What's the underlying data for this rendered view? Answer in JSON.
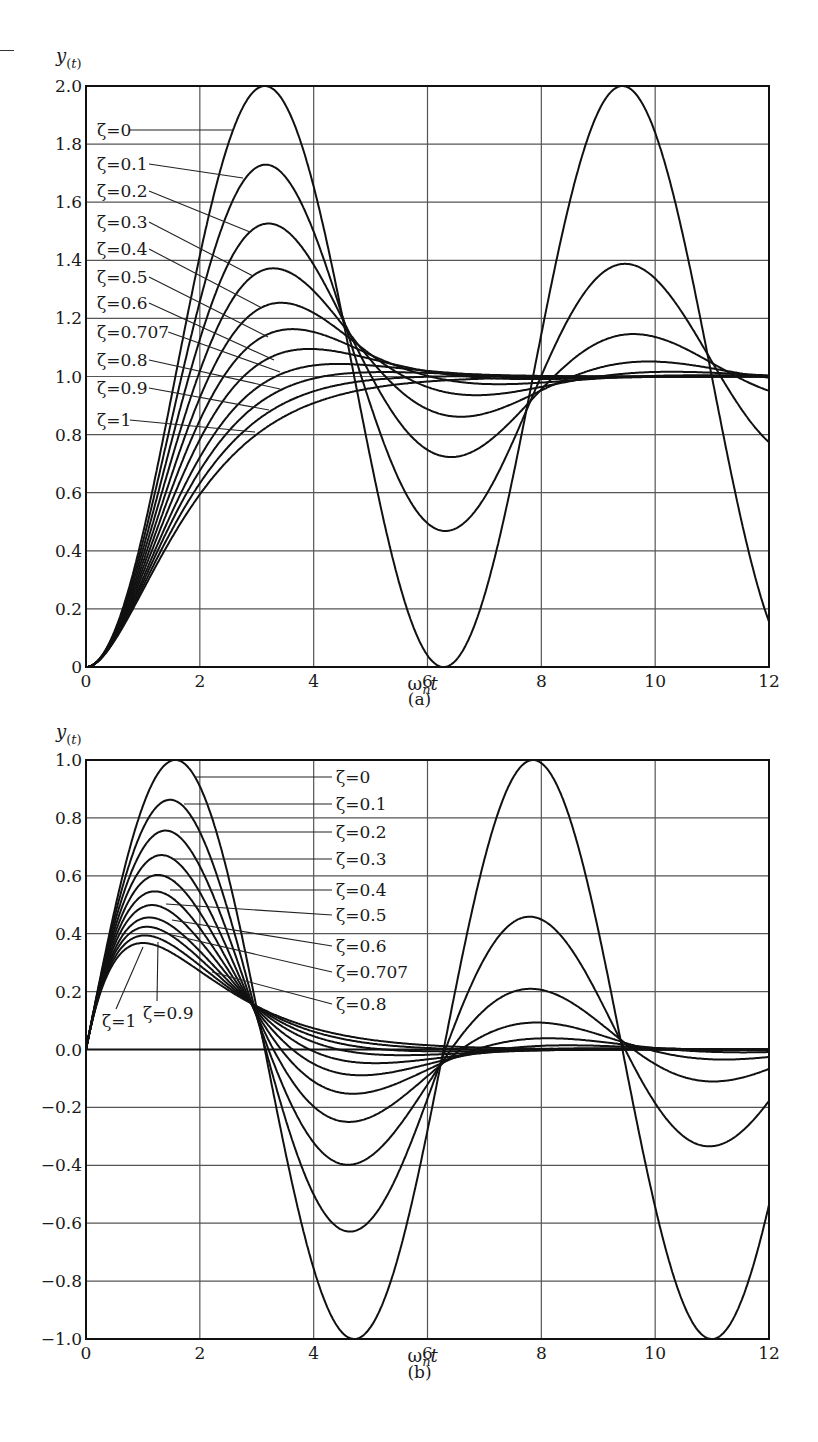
{
  "figure": {
    "captions": [
      "(a)",
      "(b)"
    ]
  },
  "chart_data": [
    {
      "type": "line",
      "title": "(a)",
      "xlabel": "ω_n t",
      "ylabel": "y(t)",
      "xlim": [
        0,
        12
      ],
      "ylim": [
        0,
        2.0
      ],
      "xticks": [
        "0",
        "2",
        "4",
        "6",
        "8",
        "10",
        "12"
      ],
      "yticks": [
        "0",
        "0.2",
        "0.4",
        "0.6",
        "0.8",
        "1.0",
        "1.2",
        "1.4",
        "1.6",
        "1.8",
        "2.0"
      ],
      "grid": true,
      "response": "step",
      "x": [
        0,
        1,
        2,
        3,
        4,
        5,
        6,
        7,
        8,
        9,
        10,
        11,
        12
      ],
      "series": [
        {
          "name": "ζ=0",
          "zeta": 0,
          "values": [
            0,
            0.46,
            1.42,
            1.99,
            1.65,
            0.72,
            0.04,
            0.25,
            1.15,
            1.91,
            1.84,
            1.0,
            0.16
          ],
          "peak": 2.0
        },
        {
          "name": "ζ=0.1",
          "zeta": 0.1,
          "values": [
            0,
            0.44,
            1.32,
            1.72,
            1.43,
            0.87,
            0.53,
            0.76,
            1.16,
            1.38,
            1.29,
            0.99,
            0.78
          ],
          "peak": 1.73
        },
        {
          "name": "ζ=0.2",
          "zeta": 0.2,
          "values": [
            0,
            0.42,
            1.23,
            1.52,
            1.28,
            0.94,
            0.74,
            0.88,
            1.1,
            1.16,
            1.1,
            0.99,
            0.95
          ],
          "peak": 1.53
        },
        {
          "name": "ζ=0.3",
          "zeta": 0.3,
          "values": [
            0,
            0.4,
            1.15,
            1.37,
            1.18,
            0.97,
            0.86,
            0.94,
            1.05,
            1.06,
            1.03,
            1.0,
            0.99
          ],
          "peak": 1.37
        },
        {
          "name": "ζ=0.4",
          "zeta": 0.4,
          "values": [
            0,
            0.38,
            1.08,
            1.25,
            1.12,
            0.99,
            0.93,
            0.97,
            1.02,
            1.02,
            1.01,
            1.0,
            1.0
          ],
          "peak": 1.25
        },
        {
          "name": "ζ=0.5",
          "zeta": 0.5,
          "values": [
            0,
            0.36,
            1.02,
            1.16,
            1.08,
            1.0,
            0.97,
            0.99,
            1.0,
            1.0,
            1.0,
            1.0,
            1.0
          ],
          "peak": 1.16
        },
        {
          "name": "ζ=0.6",
          "zeta": 0.6,
          "values": [
            0,
            0.34,
            0.97,
            1.09,
            1.06,
            1.01,
            0.99,
            1.0,
            1.0,
            1.0,
            1.0,
            1.0,
            1.0
          ],
          "peak": 1.09
        },
        {
          "name": "ζ=0.707",
          "zeta": 0.707,
          "values": [
            0,
            0.33,
            0.92,
            1.04,
            1.04,
            1.01,
            1.0,
            1.0,
            1.0,
            1.0,
            1.0,
            1.0,
            1.0
          ],
          "peak": 1.04
        },
        {
          "name": "ζ=0.8",
          "zeta": 0.8,
          "values": [
            0,
            0.31,
            0.87,
            1.01,
            1.02,
            1.01,
            1.0,
            1.0,
            1.0,
            1.0,
            1.0,
            1.0,
            1.0
          ],
          "peak": 1.015
        },
        {
          "name": "ζ=0.9",
          "zeta": 0.9,
          "values": [
            0,
            0.29,
            0.83,
            0.98,
            1.0,
            1.0,
            1.0,
            1.0,
            1.0,
            1.0,
            1.0,
            1.0,
            1.0
          ],
          "peak": 1.0
        },
        {
          "name": "ζ=1",
          "zeta": 1,
          "values": [
            0,
            0.26,
            0.59,
            0.8,
            0.91,
            0.96,
            0.98,
            0.99,
            1.0,
            1.0,
            1.0,
            1.0,
            1.0
          ],
          "peak": 1.0
        }
      ]
    },
    {
      "type": "line",
      "title": "(b)",
      "xlabel": "ω_n t",
      "ylabel": "y(t)",
      "xlim": [
        0,
        12
      ],
      "ylim": [
        -1.0,
        1.0
      ],
      "xticks": [
        "0",
        "2",
        "4",
        "6",
        "8",
        "10",
        "12"
      ],
      "yticks": [
        "-1.0",
        "-0.8",
        "-0.6",
        "-0.4",
        "-0.2",
        "0.0",
        "0.2",
        "0.4",
        "0.6",
        "0.8",
        "1.0"
      ],
      "grid": true,
      "response": "impulse",
      "x": [
        0,
        1,
        2,
        3,
        4,
        5,
        6,
        7,
        8,
        9,
        10,
        11,
        12
      ],
      "series": [
        {
          "name": "ζ=0",
          "zeta": 0,
          "values": [
            0,
            0.84,
            0.91,
            0.14,
            -0.76,
            -0.96,
            -0.28,
            0.66,
            0.99,
            0.41,
            -0.54,
            -1.0,
            -0.54
          ],
          "peak": 1.0
        },
        {
          "name": "ζ=0.1",
          "zeta": 0.1,
          "values": [
            0,
            0.76,
            0.75,
            0.11,
            -0.53,
            -0.58,
            -0.16,
            0.32,
            0.44,
            0.17,
            -0.2,
            -0.33,
            -0.16
          ],
          "peak": 0.86
        },
        {
          "name": "ζ=0.2",
          "zeta": 0.2,
          "values": [
            0,
            0.69,
            0.61,
            0.08,
            -0.36,
            -0.35,
            -0.09,
            0.16,
            0.2,
            0.07,
            -0.07,
            -0.11,
            -0.05
          ],
          "peak": 0.75
        },
        {
          "name": "ζ=0.3",
          "zeta": 0.3,
          "values": [
            0,
            0.62,
            0.5,
            0.06,
            -0.24,
            -0.2,
            -0.05,
            0.08,
            0.09,
            0.03,
            -0.03,
            -0.03,
            -0.01
          ],
          "peak": 0.67
        },
        {
          "name": "ζ=0.4",
          "zeta": 0.4,
          "values": [
            0,
            0.57,
            0.41,
            0.05,
            -0.16,
            -0.12,
            -0.02,
            0.04,
            0.04,
            0.01,
            -0.01,
            -0.01,
            0.0
          ],
          "peak": 0.6
        },
        {
          "name": "ζ=0.5",
          "zeta": 0.5,
          "values": [
            0,
            0.51,
            0.34,
            0.04,
            -0.1,
            -0.07,
            -0.01,
            0.02,
            0.02,
            0.0,
            0.0,
            0.0,
            0.0
          ],
          "peak": 0.54
        },
        {
          "name": "ζ=0.6",
          "zeta": 0.6,
          "values": [
            0,
            0.46,
            0.29,
            0.04,
            -0.06,
            -0.04,
            -0.01,
            0.01,
            0.01,
            0.0,
            0.0,
            0.0,
            0.0
          ],
          "peak": 0.5
        },
        {
          "name": "ζ=0.707",
          "zeta": 0.707,
          "values": [
            0,
            0.42,
            0.24,
            0.04,
            -0.04,
            -0.02,
            0.0,
            0.0,
            0.0,
            0.0,
            0.0,
            0.0,
            0.0
          ],
          "peak": 0.46
        },
        {
          "name": "ζ=0.8",
          "zeta": 0.8,
          "values": [
            0,
            0.4,
            0.21,
            0.05,
            -0.02,
            -0.01,
            0.0,
            0.0,
            0.0,
            0.0,
            0.0,
            0.0,
            0.0
          ],
          "peak": 0.43
        },
        {
          "name": "ζ=0.9",
          "zeta": 0.9,
          "values": [
            0,
            0.38,
            0.19,
            0.06,
            -0.01,
            0.0,
            0.0,
            0.0,
            0.0,
            0.0,
            0.0,
            0.0,
            0.0
          ],
          "peak": 0.4
        },
        {
          "name": "ζ=1",
          "zeta": 1,
          "values": [
            0,
            0.37,
            0.27,
            0.15,
            0.07,
            0.03,
            0.01,
            0.01,
            0.0,
            0.0,
            0.0,
            0.0,
            0.0
          ],
          "peak": 0.37
        }
      ]
    }
  ],
  "labels": {
    "a": [
      {
        "text": "ζ=0",
        "lx": 97,
        "ly": 130,
        "tx": 232,
        "ty": 130
      },
      {
        "text": "ζ=0.1",
        "lx": 97,
        "ly": 164,
        "tx": 243,
        "ty": 178
      },
      {
        "text": "ζ=0.2",
        "lx": 97,
        "ly": 191,
        "tx": 250,
        "ty": 232
      },
      {
        "text": "ζ=0.3",
        "lx": 97,
        "ly": 222,
        "tx": 253,
        "ty": 276
      },
      {
        "text": "ζ=0.4",
        "lx": 97,
        "ly": 249,
        "tx": 262,
        "ty": 308
      },
      {
        "text": "ζ=0.5",
        "lx": 97,
        "ly": 277,
        "tx": 268,
        "ty": 337
      },
      {
        "text": "ζ=0.6",
        "lx": 97,
        "ly": 303,
        "tx": 274,
        "ty": 360
      },
      {
        "text": "ζ=0.707",
        "lx": 97,
        "ly": 332,
        "tx": 280,
        "ty": 372
      },
      {
        "text": "ζ=0.8",
        "lx": 97,
        "ly": 360,
        "tx": 280,
        "ty": 389
      },
      {
        "text": "ζ=0.9",
        "lx": 97,
        "ly": 388,
        "tx": 269,
        "ty": 410
      },
      {
        "text": "ζ=1",
        "lx": 97,
        "ly": 420,
        "tx": 255,
        "ty": 432
      }
    ],
    "b": [
      {
        "text": "ζ=0",
        "lx": 336,
        "ly": 777,
        "tx": 196,
        "ty": 777
      },
      {
        "text": "ζ=0.1",
        "lx": 336,
        "ly": 804,
        "tx": 184,
        "ty": 804
      },
      {
        "text": "ζ=0.2",
        "lx": 336,
        "ly": 832,
        "tx": 180,
        "ty": 832
      },
      {
        "text": "ζ=0.3",
        "lx": 336,
        "ly": 859,
        "tx": 172,
        "ty": 859
      },
      {
        "text": "ζ=0.4",
        "lx": 336,
        "ly": 890,
        "tx": 170,
        "ty": 890
      },
      {
        "text": "ζ=0.5",
        "lx": 336,
        "ly": 915,
        "tx": 166,
        "ty": 904
      },
      {
        "text": "ζ=0.6",
        "lx": 336,
        "ly": 946,
        "tx": 172,
        "ty": 920
      },
      {
        "text": "ζ=0.707",
        "lx": 336,
        "ly": 972,
        "tx": 172,
        "ty": 935
      },
      {
        "text": "ζ=0.8",
        "lx": 336,
        "ly": 1004,
        "tx": 212,
        "ty": 972
      },
      {
        "text": "ζ=0.9",
        "lx": 143,
        "ly": 1013,
        "tx": 158,
        "ty": 942
      },
      {
        "text": "ζ=1",
        "lx": 102,
        "ly": 1021,
        "tx": 143,
        "ty": 947
      }
    ]
  }
}
